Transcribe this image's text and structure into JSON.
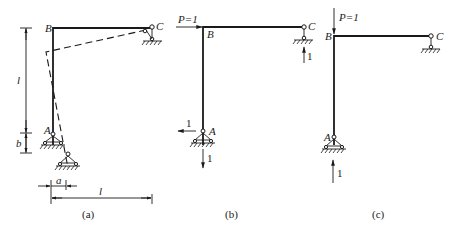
{
  "figure": {
    "panels": [
      {
        "id": "a",
        "caption": "(a)",
        "node_labels": {
          "A": "A",
          "B": "B",
          "C": "C"
        },
        "dimensions": {
          "vertical_height": "l",
          "vertical_settlement": "b",
          "horizontal_shift": "a",
          "horizontal_span": "l"
        },
        "note": "Dashed line shows displaced shape after support A moves by a horizontally and b vertically"
      },
      {
        "id": "b",
        "caption": "(b)",
        "node_labels": {
          "A": "A",
          "B": "B",
          "C": "C"
        },
        "load": "P=1",
        "load_direction": "horizontal, right at B",
        "reactions": {
          "C_vertical": "1",
          "A_horizontal": "1",
          "A_vertical": "1"
        }
      },
      {
        "id": "c",
        "caption": "(c)",
        "node_labels": {
          "A": "A",
          "B": "B",
          "C": "C"
        },
        "load": "P=1",
        "load_direction": "vertical, downward at B",
        "reactions": {
          "A_vertical": "1"
        }
      }
    ]
  },
  "colors": {
    "ink": "#1a1a1a",
    "background": "#ffffff"
  }
}
